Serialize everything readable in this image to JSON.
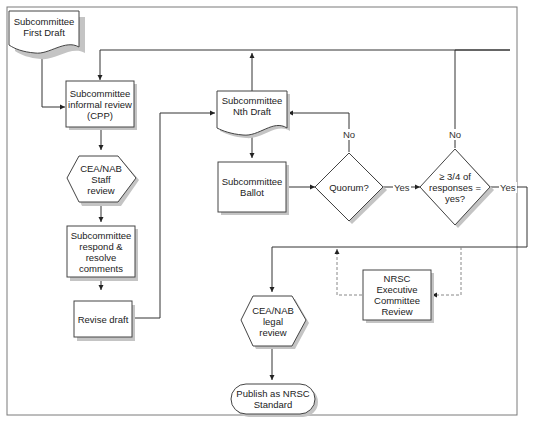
{
  "diagram": {
    "title": "",
    "frame": {
      "border_color": "#7a7a7a"
    },
    "colors": {
      "stroke": "#333333",
      "shadow": "#b3b3b3",
      "fill": "#ffffff",
      "dashed": "#888888"
    },
    "nodes": [
      {
        "id": "first_draft",
        "shape": "document",
        "label": "Subcommittee\nFirst Draft"
      },
      {
        "id": "informal_review",
        "shape": "process",
        "label": "Subcommittee\ninformal review\n(CPP)"
      },
      {
        "id": "staff_review",
        "shape": "hexagon",
        "label": "CEA/NAB\nStaff\nreview"
      },
      {
        "id": "respond_resolve",
        "shape": "process",
        "label": "Subcommittee\nrespond &\nresolve\ncomments"
      },
      {
        "id": "revise_draft",
        "shape": "process",
        "label": "Revise draft"
      },
      {
        "id": "nth_draft",
        "shape": "document",
        "label": "Subcommittee\nNth Draft"
      },
      {
        "id": "ballot",
        "shape": "process",
        "label": "Subcommittee\nBallot"
      },
      {
        "id": "quorum",
        "shape": "decision",
        "label": "Quorum?"
      },
      {
        "id": "three_quarters",
        "shape": "decision",
        "label": "≥ 3/4 of\nresponses =\nyes?"
      },
      {
        "id": "exec_review",
        "shape": "process",
        "label": "NRSC Executive\nCommittee\nReview"
      },
      {
        "id": "legal_review",
        "shape": "hexagon",
        "label": "CEA/NAB\nlegal\nreview"
      },
      {
        "id": "publish",
        "shape": "terminator",
        "label": "Publish as NRSC\nStandard"
      }
    ],
    "edges": [
      {
        "from": "first_draft",
        "to": "informal_review",
        "label": ""
      },
      {
        "from": "informal_review",
        "to": "staff_review",
        "label": ""
      },
      {
        "from": "staff_review",
        "to": "respond_resolve",
        "label": ""
      },
      {
        "from": "respond_resolve",
        "to": "revise_draft",
        "label": ""
      },
      {
        "from": "revise_draft",
        "to": "nth_draft",
        "label": ""
      },
      {
        "from": "nth_draft",
        "to": "informal_review",
        "label": ""
      },
      {
        "from": "nth_draft",
        "to": "ballot",
        "label": ""
      },
      {
        "from": "ballot",
        "to": "quorum",
        "label": ""
      },
      {
        "from": "quorum",
        "to": "nth_draft",
        "label": "No"
      },
      {
        "from": "quorum",
        "to": "three_quarters",
        "label": "Yes"
      },
      {
        "from": "three_quarters",
        "to": "informal_review",
        "label": "No"
      },
      {
        "from": "three_quarters",
        "to": "legal_review",
        "label": "Yes"
      },
      {
        "from": "exec_review",
        "to": "legal_review",
        "label": "",
        "style": "dashed"
      },
      {
        "from": "three_quarters",
        "to": "exec_review",
        "label": "",
        "style": "dashed"
      },
      {
        "from": "legal_review",
        "to": "publish",
        "label": ""
      }
    ],
    "edge_labels": {
      "quorum_no": "No",
      "quorum_yes": "Yes",
      "tq_no": "No",
      "tq_yes": "Yes"
    }
  }
}
